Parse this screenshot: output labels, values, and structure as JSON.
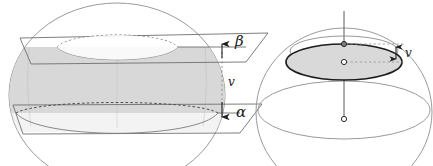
{
  "figure": {
    "type": "geometry-diagram",
    "background_color": "#ffffff",
    "colors": {
      "outline": "#8a8a8a",
      "plane_line": "#6e6e6e",
      "zone_fill": "#d7d7d7",
      "cap_fill": "#d9d9d9",
      "cap_stroke": "#1c1c1c",
      "dashed": "#5a5a5a",
      "axis": "#4a4a4a",
      "label": "#1a1a1a",
      "point_fill_open": "#ffffff",
      "point_fill_solid": "#7d7d7d"
    },
    "left_panel": {
      "name": "spherical-zone-between-planes",
      "labels": {
        "upper_plane": "β",
        "lower_plane": "α",
        "distance": "v"
      },
      "arrows": {
        "upper_direction": "up",
        "lower_direction": "down",
        "connector_style": "dashed"
      },
      "sphere": {
        "center_x": 117,
        "center_y": 95,
        "radius_x": 108,
        "radius_y": 92
      },
      "planes": [
        {
          "id": "beta",
          "label": "β",
          "cut_y": 47,
          "role": "upper-cutting-plane"
        },
        {
          "id": "alpha",
          "label": "α",
          "cut_y": 113,
          "role": "lower-cutting-plane"
        }
      ]
    },
    "right_panel": {
      "name": "sphere-with-shaded-cap",
      "labels": {
        "distance": "v"
      },
      "points": [
        {
          "id": "pole-point",
          "style": "solid",
          "role": "top-of-cap-on-axis"
        },
        {
          "id": "cap-center-point",
          "style": "open",
          "role": "cap-disk-center"
        },
        {
          "id": "sphere-center-point",
          "style": "open",
          "role": "sphere-center"
        }
      ],
      "sphere": {
        "center_x": 344,
        "center_y": 112,
        "radius_x": 88,
        "radius_y": 84
      },
      "cap": {
        "fill": "#d9d9d9",
        "stroke": "#1c1c1c",
        "role": "shaded-disk"
      },
      "axis": {
        "role": "vertical-polar-axis",
        "orientation": "vertical"
      },
      "arrows": {
        "measure_direction": "double",
        "connector_style": "dashed"
      }
    }
  }
}
